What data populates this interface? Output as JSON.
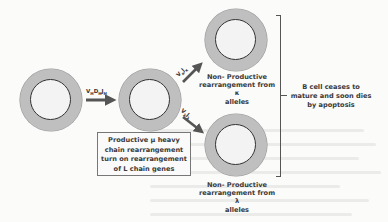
{
  "diagram": {
    "cells": [
      {
        "id": "pre-b-cell",
        "cx": 51,
        "cy": 100
      },
      {
        "id": "mu-positive-cell",
        "cx": 150,
        "cy": 100
      },
      {
        "id": "kappa-nonproductive-cell",
        "cx": 236,
        "cy": 40
      },
      {
        "id": "lambda-nonproductive-cell",
        "cx": 236,
        "cy": 145
      }
    ],
    "arrows": [
      {
        "id": "vdj-heavy",
        "label_main": [
          "V",
          "D",
          "J"
        ],
        "label_sub": [
          "H",
          "H",
          "H"
        ]
      },
      {
        "id": "vj-kappa",
        "label_main": [
          "V",
          "J"
        ],
        "label_sub": [
          "κ",
          "κ"
        ]
      },
      {
        "id": "vj-lambda",
        "label_main": [
          "V",
          "J"
        ],
        "label_sub": [
          "λ",
          "λ"
        ]
      }
    ],
    "box_text": [
      "Productive μ heavy",
      "chain rearrangement",
      "turn on rearrangement",
      "of L chain genes"
    ],
    "kappa_text": [
      "Non- Productive",
      "rearrangement from κ",
      "alleles"
    ],
    "lambda_text": [
      "Non- Productive",
      "rearrangement from λ",
      "alleles"
    ],
    "outcome_text": [
      "B cell ceases to",
      "mature and soon dies",
      "by apoptosis"
    ],
    "colors": {
      "ring": "#bfbfbf",
      "nucleus": "#f3f3f3",
      "membrane": "#333333",
      "arrow": "#555555",
      "text": "#3a3a3a"
    }
  }
}
